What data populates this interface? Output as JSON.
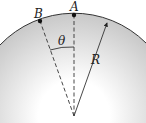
{
  "diagram": {
    "points": [
      {
        "id": "A",
        "label": "A"
      },
      {
        "id": "B",
        "label": "B"
      }
    ],
    "angle_label": "θ",
    "radius_label": "R",
    "colors": {
      "line": "#222222",
      "shade_top": "#c8c8c8",
      "shade_bottom": "#ffffff"
    }
  }
}
